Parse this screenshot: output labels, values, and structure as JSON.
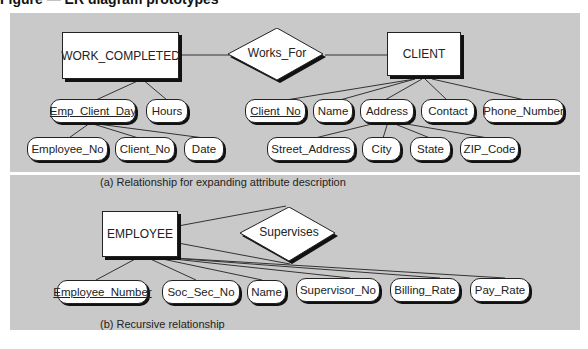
{
  "figure_caption": "Figure — ER diagram prototypes",
  "panel_a": {
    "entities": {
      "work_completed": "WORK_COMPLETED",
      "client": "CLIENT"
    },
    "relationship": "Works_For",
    "work_completed_attributes": {
      "emp_client_day": "Emp_Client_Day",
      "hours": "Hours"
    },
    "emp_client_day_parts": {
      "employee_no": "Employee_No",
      "client_no": "Client_No",
      "date": "Date"
    },
    "client_attributes": {
      "client_no": "Client_No",
      "name": "Name",
      "address": "Address",
      "contact": "Contact",
      "phone_number": "Phone_Number"
    },
    "address_parts": {
      "street_address": "Street_Address",
      "city": "City",
      "state": "State",
      "zip_code": "ZIP_Code"
    },
    "subcaption": "(a)  Relationship for expanding attribute description"
  },
  "panel_b": {
    "entity": "EMPLOYEE",
    "relationship": "Supervises",
    "attributes": {
      "employee_number": "Employee_Number",
      "soc_sec_no": "Soc_Sec_No",
      "name": "Name",
      "supervisor_no": "Supervisor_No",
      "billing_rate": "Billing_Rate",
      "pay_rate": "Pay_Rate"
    },
    "subcaption": "(b)  Recursive relationship"
  }
}
